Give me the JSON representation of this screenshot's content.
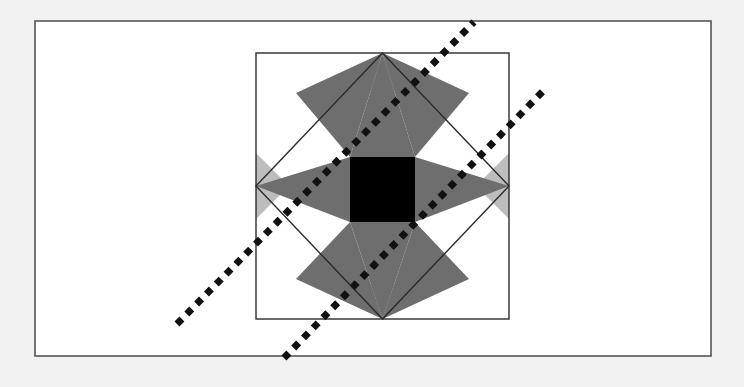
{
  "figure": {
    "title": "Eight-Pointed Star Quilt Block with Two Dotted Diagonal Lines",
    "canvas": {
      "width": 744,
      "height": 387,
      "background_color": "#f2f2f2"
    },
    "outer_frame": {
      "name": "outer-frame",
      "x": 35,
      "y": 21,
      "width": 676,
      "height": 335,
      "fill_color": "#ffffff",
      "stroke_color": "#555555",
      "stroke_width": 1.6
    },
    "block": {
      "name": "star-block",
      "x": 256,
      "y": 53,
      "width": 253,
      "height": 266,
      "center_x": 382.5,
      "center_y": 186,
      "fill_color": "#ffffff",
      "stroke_color": "#2b2b2b",
      "stroke_width": 1.4
    },
    "inscribed_diamond": {
      "name": "inscribed-diamond",
      "stroke_color": "#2b2b2b",
      "stroke_width": 1.4,
      "fill": "none",
      "points": "382.5,53 509,186 382.5,319 256,186"
    },
    "center_square": {
      "name": "center-square",
      "x": 350,
      "y": 157,
      "width": 65,
      "height": 65,
      "fill_color": "#000000"
    },
    "colors": {
      "dark_gray": "#6e6e6e",
      "light_gray": "#bdbdbd",
      "white": "#ffffff",
      "black": "#000000",
      "line_black": "#111111",
      "frame_gray": "#555555",
      "page_gray": "#f2f2f2"
    },
    "star_points": {
      "name": "eight-pointed-star",
      "fill_color": "#6e6e6e",
      "count": 8,
      "polygons": [
        "382.5,53 415,157 350,157",
        "509,186 415,222 415,157",
        "382.5,319 350,222 415,222",
        "256,186 350,157 350,222",
        "296,93 382.5,53 350,157",
        "469,93 415,157 382.5,53",
        "469,279 382.5,319 415,222",
        "296,279 350,222 382.5,319"
      ]
    },
    "light_gray_shapes": {
      "name": "light-gray-ground",
      "fill_color": "#bdbdbd",
      "polygons": [
        "350,157 415,157 382.5,124",
        "415,157 415,222 448,186",
        "415,222 350,222 382.5,255",
        "350,222 350,157 317,186",
        "350,91 415,91 382.5,58",
        "350,284 415,284 382.5,317",
        "256,153 256,219 289,186",
        "509,153 509,219 476,186"
      ]
    },
    "dotted_lines": [
      {
        "name": "dotted-line-upper",
        "x1": 177,
        "y1": 324,
        "x2": 474,
        "y2": 22,
        "color": "#111111",
        "stroke_width": 7,
        "dash_pattern": "7 7"
      },
      {
        "name": "dotted-line-lower",
        "x1": 284,
        "y1": 358,
        "x2": 546,
        "y2": 88,
        "color": "#111111",
        "stroke_width": 7,
        "dash_pattern": "7 7"
      }
    ]
  }
}
